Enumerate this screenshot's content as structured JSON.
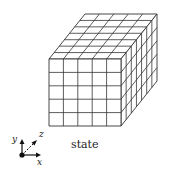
{
  "caption": "state",
  "axes": {
    "x": "x",
    "y": "y",
    "z": "z"
  },
  "cube": {
    "width_cells": 5,
    "height_cells": 5,
    "depth_cells": 7,
    "front_top_left": [
      49,
      59
    ],
    "front_bottom_right": [
      121,
      126
    ],
    "depth_offset": [
      36,
      -45
    ],
    "line_color": "#333333",
    "face_color": "#ffffff"
  }
}
